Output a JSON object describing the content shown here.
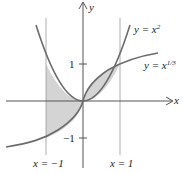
{
  "diagram": {
    "axes": {
      "x_label": "x",
      "y_label": "y"
    },
    "ticks": {
      "y_pos": "1",
      "y_neg": "−1"
    },
    "curves": [
      {
        "label_lhs": "y = x",
        "label_exp": "2",
        "expr": "x^2"
      },
      {
        "label_lhs": "y = x",
        "label_exp": "1/3",
        "expr": "x^(1/3)"
      }
    ],
    "verticals": [
      {
        "label": "x = −1"
      },
      {
        "label": "x = 1"
      }
    ],
    "shading_color": "#d4d4d4",
    "curve_color": "#6b6b6b"
  }
}
